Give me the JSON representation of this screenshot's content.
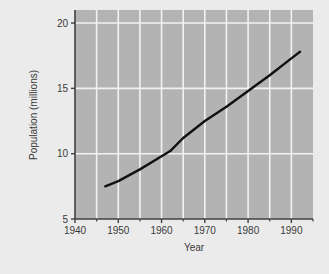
{
  "figure": {
    "background_color": "#ebebeb",
    "plot_background_color": "#b3b3b3",
    "grid_color": "#f0f0f0",
    "axis_color": "#404040",
    "line_color": "#111111"
  },
  "chart_data": {
    "type": "line",
    "title": "",
    "xlabel": "Year",
    "ylabel": "Population (millions)",
    "xlim": [
      1940,
      1995
    ],
    "ylim": [
      5,
      21
    ],
    "xticks": [
      1940,
      1950,
      1960,
      1970,
      1980,
      1990
    ],
    "xtick_labels": [
      "1940",
      "1950",
      "1960",
      "1970",
      "1980",
      "1990"
    ],
    "xminor_ticks": [
      1945,
      1955,
      1965,
      1975,
      1985,
      1995
    ],
    "yticks": [
      5,
      10,
      15,
      20
    ],
    "ytick_labels": [
      "5",
      "10",
      "15",
      "20"
    ],
    "grid": true,
    "grid_axes": "both",
    "legend": false,
    "series": [
      {
        "name": "Population",
        "x": [
          1947,
          1950,
          1955,
          1960,
          1962,
          1965,
          1970,
          1975,
          1980,
          1985,
          1990,
          1992
        ],
        "values": [
          7.5,
          7.9,
          8.8,
          9.8,
          10.2,
          11.2,
          12.5,
          13.6,
          14.8,
          16.0,
          17.3,
          17.8
        ]
      }
    ]
  }
}
